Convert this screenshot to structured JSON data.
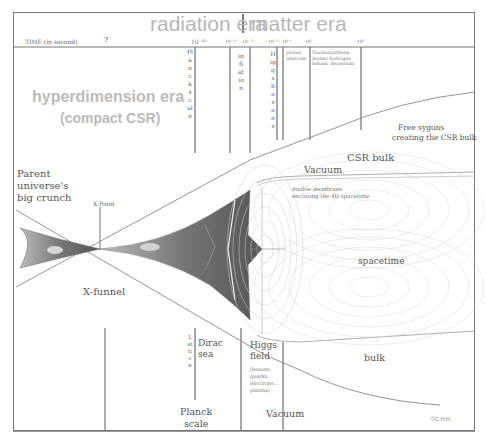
{
  "header": {
    "radiation_era": "radiation era",
    "matter_era": "matter era",
    "time_label": "TIME (in second)",
    "unknown_time": "?",
    "time_ticks": [
      {
        "label": "10⁻⁴³",
        "x": 205
      },
      {
        "label": "10⁻³⁶",
        "x": 228
      },
      {
        "label": "10⁻³²",
        "x": 250
      },
      {
        "label": "10⁻¹²",
        "x": 274
      },
      {
        "label": "10⁻⁶",
        "x": 286
      },
      {
        "label": "10²",
        "x": 308
      },
      {
        "label": "10⁵",
        "x": 360
      }
    ]
  },
  "eras": {
    "hyperdimension": "hyperdimension era",
    "compact": "(compact CSR)"
  },
  "columns": {
    "planck_scale_vertical": "Planck scale",
    "inflation_vertical": "inflation",
    "higgs_bosons_vertical": "Higgs bosons",
    "proton_neutrons": [
      "proton",
      "neutrons"
    ],
    "nucleosynthesis": [
      "Nucleosynthesis",
      "Atomic hydrogen",
      "helium, deuterium"
    ]
  },
  "labels": {
    "parent_universe": [
      "Parent",
      "universe's",
      "big crunch"
    ],
    "x_point": "X-Point",
    "x_funnel": "X-funnel",
    "free_sygons": [
      "Free sygons",
      "creating the CSR bulk"
    ],
    "csr_bulk": "CSR bulk",
    "vacuum_top": "Vacuum",
    "double_membrane": [
      "double membrane",
      "enclosing the 4D spacetime"
    ],
    "spacetime": "spacetime",
    "bulk": "bulk",
    "lattice_vertical": "Lattice",
    "dirac_sea": [
      "Dirac",
      "sea"
    ],
    "higgs_field": [
      "Higgs",
      "field"
    ],
    "higgs_particles": [
      "(bosons,",
      "quarks,",
      "electrons...",
      "plasma)"
    ],
    "planck_scale_bottom": [
      "Planck",
      "scale"
    ],
    "vacuum_bottom": "Vacuum",
    "copyright": "©C.H.H."
  },
  "colors": {
    "era_text": "#b7b7b7",
    "line": "#777777",
    "shape_dark": "#6a6a6a",
    "grid": "#c8c8c8"
  }
}
